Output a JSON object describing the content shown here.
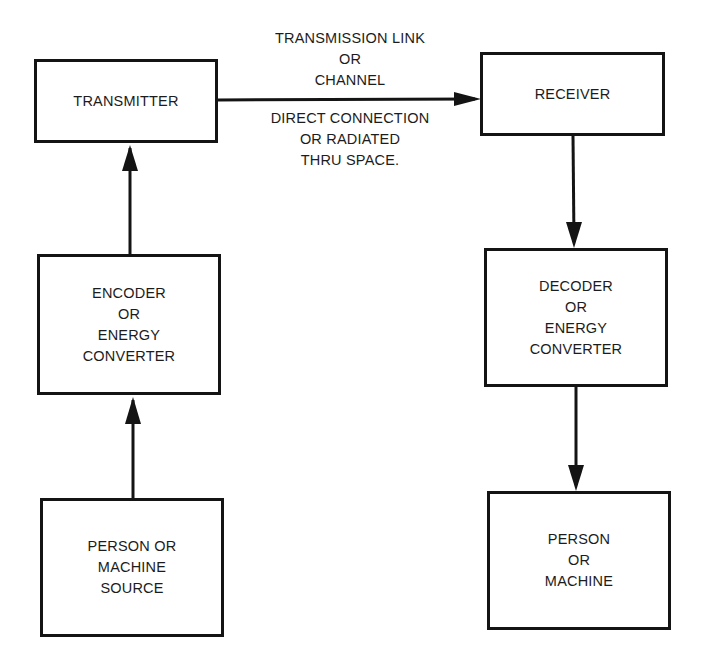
{
  "diagram": {
    "type": "block-flow",
    "title_fragment": "",
    "colors": {
      "stroke": "#141414",
      "text": "#1c1c1c",
      "background": "#ffffff"
    },
    "blocks": {
      "transmitter": {
        "lines": [
          "TRANSMITTER"
        ]
      },
      "encoder": {
        "lines": [
          "ENCODER",
          "OR",
          "ENERGY",
          "CONVERTER"
        ]
      },
      "source": {
        "lines": [
          "PERSON OR",
          "MACHINE",
          "SOURCE"
        ]
      },
      "receiver": {
        "lines": [
          "RECEIVER"
        ]
      },
      "decoder": {
        "lines": [
          "DECODER",
          "OR",
          "ENERGY",
          "CONVERTER"
        ]
      },
      "destination": {
        "lines": [
          "PERSON",
          "OR",
          "MACHINE"
        ]
      }
    },
    "link": {
      "above": [
        "TRANSMISSION LINK",
        "OR",
        "CHANNEL"
      ],
      "below": [
        "DIRECT CONNECTION",
        "OR RADIATED",
        "THRU SPACE."
      ]
    },
    "edges": [
      {
        "from": "source",
        "to": "encoder",
        "direction": "up"
      },
      {
        "from": "encoder",
        "to": "transmitter",
        "direction": "up"
      },
      {
        "from": "transmitter",
        "to": "receiver",
        "direction": "right"
      },
      {
        "from": "receiver",
        "to": "decoder",
        "direction": "down"
      },
      {
        "from": "decoder",
        "to": "destination",
        "direction": "down"
      }
    ]
  }
}
